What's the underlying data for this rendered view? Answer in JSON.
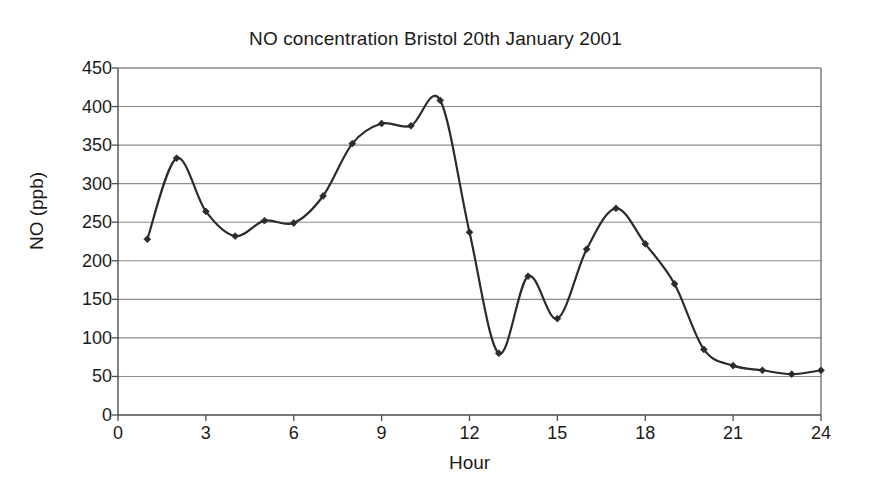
{
  "chart_data": {
    "type": "line",
    "title": "NO concentration Bristol 20th January 2001",
    "xlabel": "Hour",
    "ylabel": "NO (ppb)",
    "xlim": [
      0,
      24
    ],
    "ylim": [
      0,
      450
    ],
    "grid": "horizontal",
    "legend": "none",
    "marker": "diamond",
    "line_color": "#2b2b2b",
    "grid_color": "#8c8c8c",
    "axis_color": "#4d4d4d",
    "smoothing": "spline",
    "x": [
      1,
      2,
      3,
      4,
      5,
      6,
      7,
      8,
      9,
      10,
      11,
      12,
      13,
      14,
      15,
      16,
      17,
      18,
      19,
      20,
      21,
      22,
      23,
      24
    ],
    "y": [
      228,
      333,
      264,
      232,
      252,
      249,
      284,
      352,
      378,
      375,
      408,
      237,
      80,
      180,
      125,
      215,
      268,
      222,
      170,
      85,
      64,
      58,
      53,
      58
    ],
    "xticks": [
      0,
      3,
      6,
      9,
      12,
      15,
      18,
      21,
      24
    ],
    "xtick_labels": [
      "0",
      "3",
      "6",
      "9",
      "12",
      "15",
      "18",
      "21",
      "24"
    ],
    "yticks": [
      0,
      50,
      100,
      150,
      200,
      250,
      300,
      350,
      400,
      450
    ],
    "ytick_labels": [
      "0",
      "50",
      "100",
      "150",
      "200",
      "250",
      "300",
      "350",
      "400",
      "450"
    ],
    "series_name": "NO concentration"
  },
  "figure": {
    "background": "#ffffff"
  }
}
